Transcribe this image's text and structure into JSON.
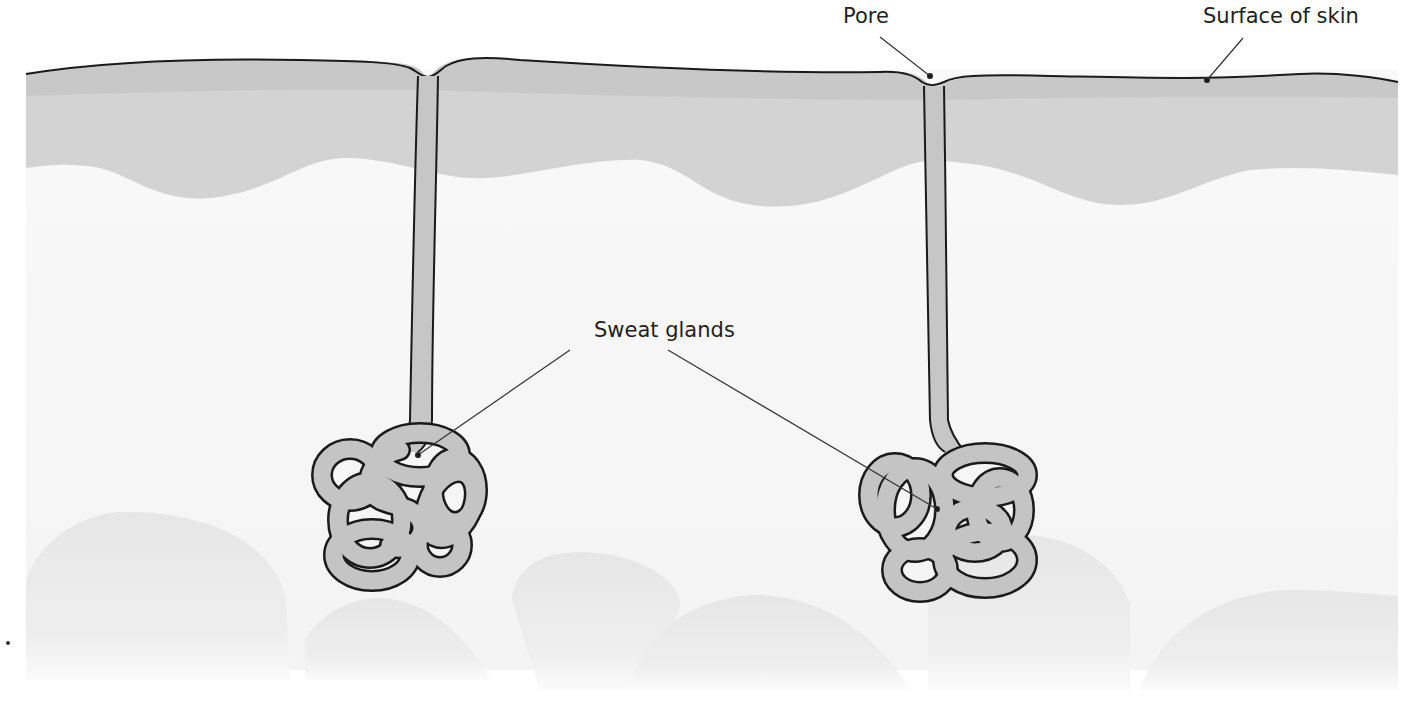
{
  "diagram": {
    "labels": {
      "pore": "Pore",
      "surface": "Surface of skin",
      "glands": "Sweat glands"
    },
    "colors": {
      "epidermis_top": "#c9c9c9",
      "epidermis": "#d4d4d4",
      "dermis": "#f7f7f7",
      "gland_fill": "#c4c4c4",
      "outline": "#1a1a1a",
      "subcutaneous_lobes": "#ececec"
    }
  }
}
